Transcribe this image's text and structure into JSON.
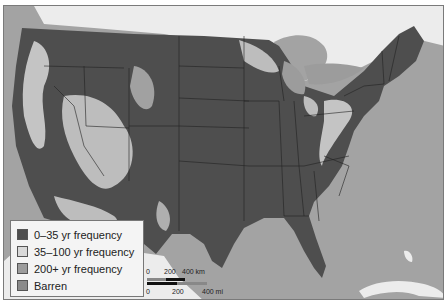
{
  "legend": {
    "items": [
      {
        "label": "0–35 yr frequency",
        "color": "#4e4e4e"
      },
      {
        "label": "35–100 yr frequency",
        "color": "#d9d9d9"
      },
      {
        "label": "200+ yr frequency",
        "color": "#9c9c9c"
      },
      {
        "label": "Barren",
        "color": "#8a8a8a"
      }
    ]
  },
  "scale_bar": {
    "km_labels": [
      "0",
      "200",
      "400 km"
    ],
    "mi_labels": [
      "0",
      "200",
      "400 mi"
    ]
  },
  "colors": {
    "water": "#a3a3a3",
    "canada_mexico": "#e8e8e8",
    "frequent": "#4e4e4e",
    "moderate": "#d9d9d9",
    "rare": "#9c9c9c",
    "border": "#222222"
  }
}
